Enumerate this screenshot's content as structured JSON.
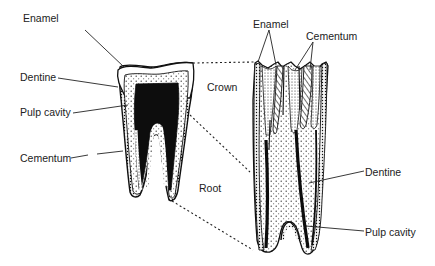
{
  "diagram": {
    "colors": {
      "ink": "#1a1a1a",
      "background": "#ffffff",
      "pulp_fill": "#0d0d0d",
      "label_text": "#222222"
    },
    "left_tooth": {
      "description": "Whole tooth, sectional view",
      "labels": [
        {
          "id": "enamel",
          "text": "Enamel",
          "x": 23,
          "y": 18
        },
        {
          "id": "dentine",
          "text": "Dentine",
          "x": 20,
          "y": 71
        },
        {
          "id": "pulp_cavity",
          "text": "Pulp cavity",
          "x": 20,
          "y": 106
        },
        {
          "id": "cementum",
          "text": "Cementum",
          "x": 20,
          "y": 152
        }
      ]
    },
    "regions": [
      {
        "id": "crown",
        "text": "Crown",
        "x": 207,
        "y": 81
      },
      {
        "id": "root",
        "text": "Root",
        "x": 199,
        "y": 182
      }
    ],
    "right_tooth": {
      "description": "Enlarged longitudinal section",
      "labels": [
        {
          "id": "enamel",
          "text": "Enamel",
          "x": 253,
          "y": 18
        },
        {
          "id": "cementum",
          "text": "Cementum",
          "x": 306,
          "y": 30
        },
        {
          "id": "dentine",
          "text": "Dentine",
          "x": 365,
          "y": 166
        },
        {
          "id": "pulp_cavity",
          "text": "Pulp cavity",
          "x": 365,
          "y": 226
        }
      ]
    }
  }
}
